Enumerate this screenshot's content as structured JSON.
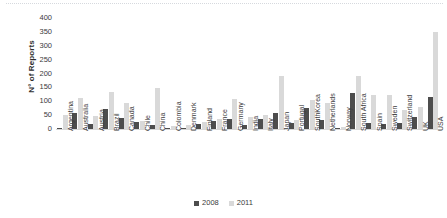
{
  "chart_data": {
    "type": "bar",
    "title": "",
    "subtitle": "",
    "xlabel": "",
    "ylabel": "N° of Reports",
    "ylim": [
      0,
      400
    ],
    "ytick_values": [
      400,
      350,
      300,
      250,
      200,
      150,
      100,
      50,
      0
    ],
    "ytick_labels": [
      "400",
      "350",
      "300",
      "250",
      "200",
      "150",
      "100",
      "50",
      "0"
    ],
    "grid": false,
    "legend_position": "bottom-center",
    "categories": [
      "Argentina",
      "Australia",
      "Austria",
      "Brazil",
      "Canada",
      "Chile",
      "China",
      "Colombia",
      "Denmark",
      "Finland",
      "France",
      "Germany",
      "India",
      "Italy",
      "Japan",
      "Portugal",
      "SouthKorea",
      "Netherlands",
      "Norway",
      "South Africa",
      "Spain",
      "Sweden",
      "Switzerland",
      "UK",
      "USA"
    ],
    "series": [
      {
        "name": "2008",
        "color": "#4d4d4d",
        "values": [
          3,
          57,
          18,
          73,
          38,
          27,
          16,
          4,
          2,
          17,
          30,
          36,
          14,
          37,
          56,
          23,
          77,
          34,
          2,
          131,
          20,
          19,
          23,
          45,
          115
        ]
      },
      {
        "name": "2011",
        "color": "#d9d9d9",
        "values": [
          50,
          110,
          48,
          132,
          92,
          28,
          147,
          11,
          13,
          26,
          37,
          108,
          43,
          52,
          190,
          31,
          106,
          94,
          9,
          190,
          122,
          124,
          70,
          80,
          350
        ]
      }
    ]
  },
  "axis": {
    "y_title": "N° of Reports"
  },
  "legend": {
    "items": [
      {
        "label": "2008",
        "color": "#4d4d4d"
      },
      {
        "label": "2011",
        "color": "#d9d9d9"
      }
    ]
  }
}
